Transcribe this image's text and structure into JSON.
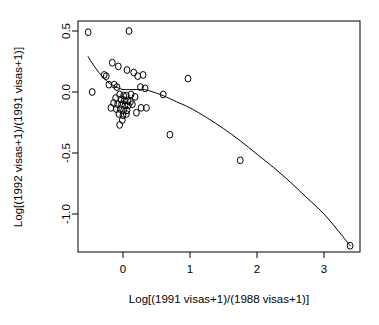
{
  "chart_data": {
    "type": "scatter",
    "title": "",
    "xlabel": "Log[(1991 visas+1)/(1988 visas+1)]",
    "ylabel": "Log[(1992 visas+1)/(1991 visas+1)]",
    "xlim": [
      -0.78,
      3.54
    ],
    "ylim": [
      -1.36,
      0.58
    ],
    "xticks": [
      0,
      1,
      2,
      3
    ],
    "xticklabels": [
      "0",
      "1",
      "2",
      "3"
    ],
    "yticks": [
      0.5,
      0.0,
      -0.5,
      -1.0
    ],
    "yticklabels": [
      "0.5",
      "0.0",
      "-0.5",
      "-1.0"
    ],
    "grid": false,
    "legend": null,
    "marker": "open-circle",
    "points": [
      {
        "x": -0.52,
        "y": 0.49
      },
      {
        "x": 0.09,
        "y": 0.5
      },
      {
        "x": -0.16,
        "y": 0.24
      },
      {
        "x": -0.07,
        "y": 0.21
      },
      {
        "x": 0.06,
        "y": 0.18
      },
      {
        "x": 0.16,
        "y": 0.16
      },
      {
        "x": -0.28,
        "y": 0.14
      },
      {
        "x": -0.25,
        "y": 0.13
      },
      {
        "x": 0.22,
        "y": 0.13
      },
      {
        "x": 0.3,
        "y": 0.14
      },
      {
        "x": 0.97,
        "y": 0.11
      },
      {
        "x": -0.21,
        "y": 0.06
      },
      {
        "x": -0.13,
        "y": 0.06
      },
      {
        "x": -0.09,
        "y": 0.04
      },
      {
        "x": 0.26,
        "y": 0.04
      },
      {
        "x": 0.33,
        "y": 0.03
      },
      {
        "x": 0.6,
        "y": -0.02
      },
      {
        "x": -0.46,
        "y": 0.0
      },
      {
        "x": -0.05,
        "y": -0.02
      },
      {
        "x": 0.01,
        "y": -0.03
      },
      {
        "x": 0.05,
        "y": -0.03
      },
      {
        "x": 0.12,
        "y": -0.02
      },
      {
        "x": 0.18,
        "y": -0.04
      },
      {
        "x": -0.11,
        "y": -0.05
      },
      {
        "x": -0.03,
        "y": -0.06
      },
      {
        "x": 0.02,
        "y": -0.07
      },
      {
        "x": 0.07,
        "y": -0.07
      },
      {
        "x": 0.11,
        "y": -0.08
      },
      {
        "x": -0.14,
        "y": -0.09
      },
      {
        "x": -0.08,
        "y": -0.1
      },
      {
        "x": -0.02,
        "y": -0.1
      },
      {
        "x": 0.03,
        "y": -0.11
      },
      {
        "x": 0.08,
        "y": -0.11
      },
      {
        "x": 0.14,
        "y": -0.1
      },
      {
        "x": -0.18,
        "y": -0.13
      },
      {
        "x": -0.1,
        "y": -0.14
      },
      {
        "x": -0.04,
        "y": -0.14
      },
      {
        "x": 0.01,
        "y": -0.15
      },
      {
        "x": 0.06,
        "y": -0.15
      },
      {
        "x": 0.27,
        "y": -0.13
      },
      {
        "x": 0.35,
        "y": -0.13
      },
      {
        "x": -0.06,
        "y": -0.18
      },
      {
        "x": 0.0,
        "y": -0.19
      },
      {
        "x": 0.05,
        "y": -0.18
      },
      {
        "x": 0.2,
        "y": -0.17
      },
      {
        "x": -0.01,
        "y": -0.23
      },
      {
        "x": -0.05,
        "y": -0.27
      },
      {
        "x": 0.7,
        "y": -0.35
      },
      {
        "x": 1.75,
        "y": -0.56
      },
      {
        "x": 3.39,
        "y": -1.26
      }
    ],
    "fit_curve": {
      "label": "smoothed fit line",
      "points": [
        {
          "x": -0.52,
          "y": 0.29
        },
        {
          "x": -0.44,
          "y": 0.22
        },
        {
          "x": -0.36,
          "y": 0.16
        },
        {
          "x": -0.28,
          "y": 0.11
        },
        {
          "x": -0.2,
          "y": 0.07
        },
        {
          "x": -0.1,
          "y": 0.04
        },
        {
          "x": 0.0,
          "y": 0.02
        },
        {
          "x": 0.1,
          "y": 0.02
        },
        {
          "x": 0.2,
          "y": 0.02
        },
        {
          "x": 0.32,
          "y": 0.02
        },
        {
          "x": 0.45,
          "y": 0.0
        },
        {
          "x": 0.6,
          "y": -0.03
        },
        {
          "x": 0.8,
          "y": -0.08
        },
        {
          "x": 1.0,
          "y": -0.13
        },
        {
          "x": 1.25,
          "y": -0.21
        },
        {
          "x": 1.5,
          "y": -0.3
        },
        {
          "x": 1.75,
          "y": -0.4
        },
        {
          "x": 2.0,
          "y": -0.51
        },
        {
          "x": 2.25,
          "y": -0.62
        },
        {
          "x": 2.5,
          "y": -0.74
        },
        {
          "x": 2.75,
          "y": -0.87
        },
        {
          "x": 3.0,
          "y": -1.0
        },
        {
          "x": 3.2,
          "y": -1.13
        },
        {
          "x": 3.39,
          "y": -1.26
        }
      ]
    }
  }
}
